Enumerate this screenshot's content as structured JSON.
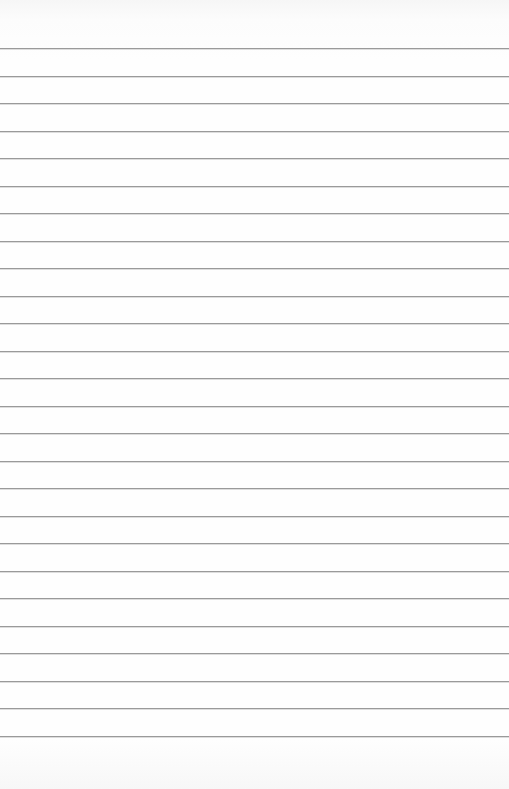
{
  "page": {
    "type": "lined-paper",
    "background_color": "#fdfdfd",
    "line_color": "#9a9a9a",
    "line_count": 26,
    "first_line_y": 48,
    "line_spacing": 27.52
  }
}
